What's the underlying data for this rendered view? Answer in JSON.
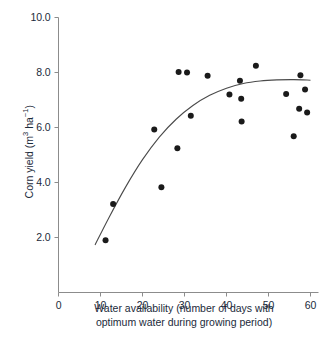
{
  "chart_data": {
    "type": "scatter",
    "title": "",
    "xlabel": "Water availability (number of days with optimum water during growing period)",
    "xlabel_line1": "Water availability (number of days with",
    "xlabel_line2": "optimum water during growing period)",
    "ylabel": "Corn yield (m³ ha⁻¹)",
    "ylabel_prefix": "Corn yield (m",
    "ylabel_sup1": "3",
    "ylabel_mid": " ha",
    "ylabel_sup2": "−1",
    "ylabel_suffix": ")",
    "xlim": [
      0,
      60
    ],
    "ylim": [
      0,
      10
    ],
    "xticks": [
      0,
      10,
      20,
      30,
      40,
      50,
      60
    ],
    "xtick_labels": [
      "0",
      "10",
      "20",
      "30",
      "40",
      "50",
      "60"
    ],
    "yticks": [
      2.0,
      4.0,
      6.0,
      8.0,
      10.0
    ],
    "ytick_labels": [
      "2.0",
      "4.0",
      "6.0",
      "8.0",
      "10.0"
    ],
    "grid": false,
    "legend": "none",
    "marker_color": "#1a1a1a",
    "marker_size": 3.0,
    "axis_color": "#8c8c8c",
    "curve_color": "#4a4a4a",
    "text_color": "#1b2a3a",
    "background": "#ffffff",
    "x": [
      11.2,
      13.0,
      22.8,
      24.5,
      28.3,
      28.6,
      30.6,
      31.5,
      35.5,
      40.7,
      43.2,
      43.5,
      43.6,
      47.0,
      54.2,
      56.0,
      57.3,
      57.6,
      58.7,
      59.2
    ],
    "y": [
      1.9,
      3.22,
      5.93,
      3.83,
      5.25,
      8.02,
      8.0,
      6.43,
      7.88,
      7.2,
      7.7,
      7.05,
      6.22,
      8.25,
      7.22,
      5.68,
      6.68,
      7.9,
      7.38,
      6.55
    ],
    "points": [
      {
        "x": 11.2,
        "y": 1.9
      },
      {
        "x": 13.0,
        "y": 3.22
      },
      {
        "x": 22.8,
        "y": 5.93
      },
      {
        "x": 24.5,
        "y": 3.83
      },
      {
        "x": 28.3,
        "y": 5.25
      },
      {
        "x": 28.6,
        "y": 8.02
      },
      {
        "x": 30.6,
        "y": 8.0
      },
      {
        "x": 31.5,
        "y": 6.43
      },
      {
        "x": 35.5,
        "y": 7.88
      },
      {
        "x": 40.7,
        "y": 7.2
      },
      {
        "x": 43.2,
        "y": 7.7
      },
      {
        "x": 43.5,
        "y": 7.05
      },
      {
        "x": 43.6,
        "y": 6.22
      },
      {
        "x": 47.0,
        "y": 8.25
      },
      {
        "x": 54.2,
        "y": 7.22
      },
      {
        "x": 56.0,
        "y": 5.68
      },
      {
        "x": 57.3,
        "y": 6.68
      },
      {
        "x": 57.6,
        "y": 7.9
      },
      {
        "x": 58.7,
        "y": 7.38
      },
      {
        "x": 59.2,
        "y": 6.55
      }
    ],
    "fit_curve": {
      "description": "quadratic saturating trend line",
      "x_start": 8.7,
      "x_end": 60.0,
      "points": [
        {
          "x": 8.7,
          "y": 1.73
        },
        {
          "x": 12.0,
          "y": 2.72
        },
        {
          "x": 16.0,
          "y": 3.84
        },
        {
          "x": 20.0,
          "y": 4.83
        },
        {
          "x": 24.0,
          "y": 5.65
        },
        {
          "x": 28.0,
          "y": 6.3
        },
        {
          "x": 32.0,
          "y": 6.8
        },
        {
          "x": 36.0,
          "y": 7.17
        },
        {
          "x": 40.0,
          "y": 7.43
        },
        {
          "x": 44.0,
          "y": 7.6
        },
        {
          "x": 48.0,
          "y": 7.69
        },
        {
          "x": 52.0,
          "y": 7.73
        },
        {
          "x": 56.0,
          "y": 7.74
        },
        {
          "x": 60.0,
          "y": 7.72
        }
      ]
    }
  }
}
